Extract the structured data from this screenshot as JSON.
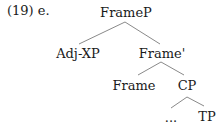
{
  "example": {
    "number": "(19)",
    "sub": "e."
  },
  "tree": {
    "root": "FrameP",
    "left": "Adj-XP",
    "bar": "Frame'",
    "head": "Frame",
    "complement": "CP",
    "ellipsis": "...",
    "tp": "TP"
  },
  "colors": {
    "line": "#6b6b6b",
    "text": "#1a1a1a"
  }
}
